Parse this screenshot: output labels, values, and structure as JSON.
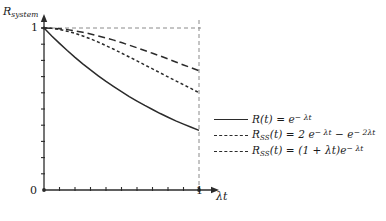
{
  "figure": {
    "background_color": "#ffffff",
    "ink_color": "#2b2b2b",
    "guide_color": "#8a8a8a"
  },
  "axes": {
    "ylabel": "R",
    "ylabel_sub": "system",
    "xlabel": "λt",
    "origin_label": "0",
    "ytick_label": "1",
    "xtick_label": "1"
  },
  "legend": {
    "entries": [
      {
        "style": "solid",
        "name": "R",
        "sub": "",
        "arg": "(t)",
        "eq": " = ",
        "base": "e",
        "exp": "− λt",
        "tail": ""
      },
      {
        "style": "short-dash",
        "name": "R",
        "sub": "SS",
        "arg": "(t)",
        "eq": " = ",
        "base": "2 e",
        "exp": "− λt",
        "tail": " − e",
        "tail_exp": "− 2λt"
      },
      {
        "style": "long-dash",
        "name": "R",
        "sub": "SS",
        "arg": "(t)",
        "eq": " = ",
        "base": "(1 +  λt)e",
        "exp": "− λt",
        "tail": ""
      }
    ]
  },
  "chart_data": {
    "type": "line",
    "title": "",
    "xlabel": "λt",
    "ylabel": "R_system",
    "xlim": [
      0,
      1.0
    ],
    "ylim": [
      0,
      1.05
    ],
    "grid": false,
    "legend_position": "bottom-right",
    "annotations": [
      {
        "kind": "guide-line",
        "orientation": "horizontal",
        "value": 1.0,
        "style": "dashed"
      },
      {
        "kind": "guide-line",
        "orientation": "vertical",
        "value": 1.0,
        "style": "dashed"
      }
    ],
    "x": [
      0,
      0.05,
      0.1,
      0.15,
      0.2,
      0.25,
      0.3,
      0.35,
      0.4,
      0.45,
      0.5,
      0.55,
      0.6,
      0.65,
      0.7,
      0.75,
      0.8,
      0.85,
      0.9,
      0.95,
      1.0
    ],
    "series": [
      {
        "name": "R(t) = e^(-λt)",
        "style": "solid",
        "values": [
          1.0,
          0.951,
          0.905,
          0.861,
          0.819,
          0.779,
          0.741,
          0.705,
          0.67,
          0.638,
          0.607,
          0.577,
          0.549,
          0.522,
          0.497,
          0.472,
          0.449,
          0.427,
          0.407,
          0.387,
          0.368
        ]
      },
      {
        "name": "R_SS(t) = 2e^(-λt) - e^(-2λt)",
        "style": "short-dash",
        "values": [
          1.0,
          0.998,
          0.991,
          0.98,
          0.967,
          0.951,
          0.933,
          0.913,
          0.891,
          0.869,
          0.845,
          0.821,
          0.797,
          0.772,
          0.748,
          0.723,
          0.698,
          0.674,
          0.65,
          0.626,
          0.6
        ]
      },
      {
        "name": "R_SS(t) = (1 + λt)e^(-λt)",
        "style": "long-dash",
        "values": [
          1.0,
          0.999,
          0.995,
          0.99,
          0.982,
          0.974,
          0.963,
          0.951,
          0.938,
          0.925,
          0.91,
          0.894,
          0.878,
          0.861,
          0.844,
          0.827,
          0.809,
          0.79,
          0.772,
          0.754,
          0.736
        ]
      }
    ]
  }
}
